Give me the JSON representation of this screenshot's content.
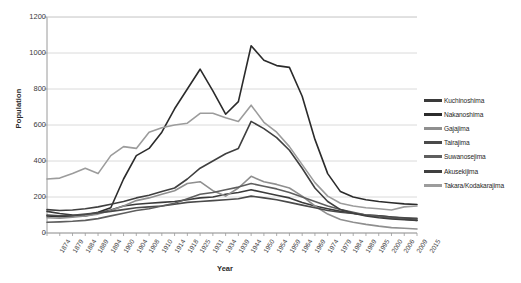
{
  "chart_data": {
    "type": "line",
    "title": "",
    "xlabel": "Year",
    "ylabel": "Population",
    "ylim": [
      0,
      1200
    ],
    "ytick_step": 200,
    "grid": true,
    "legend_position": "right",
    "yticks": [
      "0",
      "200",
      "400",
      "600",
      "800",
      "1000",
      "1200"
    ],
    "categories": [
      "1874",
      "1879",
      "1884",
      "1889",
      "1894",
      "1900",
      "1904",
      "1908",
      "1910",
      "1914",
      "1918",
      "1925",
      "1931",
      "1934",
      "1939",
      "1944",
      "1950",
      "1954",
      "1959",
      "1964",
      "1969",
      "1974",
      "1979",
      "1984",
      "1989",
      "1995",
      "2000",
      "2006",
      "2009",
      "2015"
    ],
    "series": [
      {
        "name": "Kuchinoshima",
        "color": "#3a3a3a",
        "values": [
          120,
          108,
          100,
          95,
          110,
          128,
          150,
          160,
          165,
          170,
          175,
          185,
          195,
          200,
          215,
          225,
          240,
          225,
          210,
          195,
          170,
          150,
          135,
          120,
          110,
          100,
          95,
          88,
          82,
          78
        ]
      },
      {
        "name": "Nakanoshima",
        "color": "#2b2b2b",
        "values": [
          95,
          90,
          92,
          100,
          115,
          140,
          300,
          430,
          470,
          560,
          690,
          800,
          910,
          790,
          660,
          730,
          1040,
          960,
          930,
          920,
          760,
          520,
          330,
          230,
          200,
          185,
          175,
          168,
          162,
          158
        ]
      },
      {
        "name": "Gajajima",
        "color": "#8f8f8f",
        "values": [
          85,
          82,
          88,
          95,
          105,
          125,
          150,
          180,
          195,
          215,
          235,
          275,
          285,
          235,
          205,
          250,
          315,
          285,
          270,
          250,
          205,
          150,
          105,
          75,
          60,
          48,
          38,
          30,
          26,
          22
        ]
      },
      {
        "name": "Tairajima",
        "color": "#4a4a4a",
        "values": [
          100,
          96,
          98,
          105,
          112,
          120,
          130,
          140,
          145,
          150,
          160,
          170,
          175,
          180,
          185,
          190,
          205,
          195,
          185,
          170,
          155,
          140,
          125,
          115,
          108,
          100,
          95,
          88,
          85,
          82
        ]
      },
      {
        "name": "Suwanosejima",
        "color": "#5e5e5e",
        "values": [
          60,
          62,
          65,
          70,
          80,
          95,
          110,
          125,
          135,
          150,
          165,
          190,
          215,
          225,
          240,
          255,
          275,
          260,
          245,
          225,
          200,
          175,
          150,
          130,
          115,
          100,
          90,
          82,
          76,
          70
        ]
      },
      {
        "name": "Akusekijima",
        "color": "#3f3f3f",
        "values": [
          130,
          125,
          128,
          135,
          145,
          160,
          175,
          195,
          210,
          230,
          250,
          300,
          360,
          400,
          440,
          470,
          620,
          580,
          530,
          460,
          360,
          250,
          175,
          130,
          110,
          95,
          85,
          78,
          74,
          70
        ]
      },
      {
        "name": "Takara/Kodakarajima",
        "color": "#9c9c9c",
        "values": [
          300,
          305,
          330,
          360,
          330,
          430,
          480,
          470,
          560,
          585,
          600,
          610,
          665,
          665,
          640,
          620,
          710,
          615,
          560,
          480,
          380,
          280,
          205,
          165,
          150,
          140,
          135,
          128,
          145,
          150
        ]
      }
    ]
  }
}
